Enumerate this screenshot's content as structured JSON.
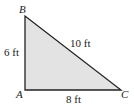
{
  "diagram": {
    "type": "right-triangle",
    "fill_color": "#e3e3e3",
    "stroke_color": "#222222",
    "vertices": [
      {
        "name": "B",
        "label": "B"
      },
      {
        "name": "A",
        "label": "A"
      },
      {
        "name": "C",
        "label": "C"
      }
    ],
    "sides": {
      "AB": "6 ft",
      "BC": "10 ft",
      "AC": "8 ft"
    }
  }
}
